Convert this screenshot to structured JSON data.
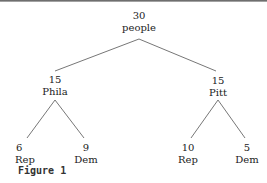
{
  "diagram": {
    "type": "tree",
    "root": {
      "count": "30",
      "label": "people"
    },
    "level1": [
      {
        "count": "15",
        "label": "Phila"
      },
      {
        "count": "15",
        "label": "Pitt"
      }
    ],
    "level2": [
      {
        "count": "6",
        "label": "Rep",
        "parent": "Phila"
      },
      {
        "count": "9",
        "label": "Dem",
        "parent": "Phila"
      },
      {
        "count": "10",
        "label": "Rep",
        "parent": "Pitt"
      },
      {
        "count": "5",
        "label": "Dem",
        "parent": "Pitt"
      }
    ],
    "edge_color": "#777777"
  },
  "caption": "Figure 1"
}
